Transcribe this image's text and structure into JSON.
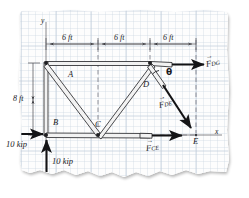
{
  "figure": {
    "kind": "truss-free-body-diagram",
    "medium": "graph paper sketch",
    "paper_color": "#fdfdfd",
    "grid_color": "#c9d2de",
    "ink_color": "#1a1a1d"
  },
  "axes": {
    "y_label": "y",
    "x_label": "x"
  },
  "dimensions": {
    "horizontal": [
      {
        "label": "6 ft"
      },
      {
        "label": "6 ft"
      },
      {
        "label": "6 ft"
      }
    ],
    "vertical": [
      {
        "label": "8 ft"
      }
    ]
  },
  "nodes": [
    {
      "label": "A"
    },
    {
      "label": "B"
    },
    {
      "label": "C"
    },
    {
      "label": "D"
    },
    {
      "label": "E"
    }
  ],
  "angle": {
    "label": "θ"
  },
  "forces": [
    {
      "name": "F_DG",
      "base": "F",
      "sub": "DG",
      "direction": "right",
      "type": "member-force"
    },
    {
      "name": "F_DE",
      "base": "F",
      "sub": "DE",
      "direction": "down-right",
      "type": "member-force"
    },
    {
      "name": "F_CE",
      "base": "F",
      "sub": "CE",
      "direction": "right",
      "type": "member-force"
    }
  ],
  "loads": [
    {
      "label": "10 kip",
      "direction": "right",
      "position": "left-support-horizontal"
    },
    {
      "label": "10 kip",
      "direction": "up",
      "position": "left-support-vertical"
    }
  ]
}
